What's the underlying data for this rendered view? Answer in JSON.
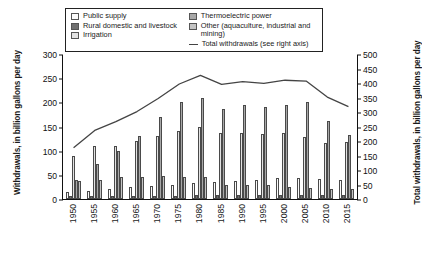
{
  "chart_data": {
    "type": "bar",
    "title": "",
    "xlabel": "",
    "ylabel": "Withdrawals, in billion gallons per day",
    "ylabel_right": "Total withdrawals, in billion gallons per day",
    "categories": [
      "1950",
      "1955",
      "1960",
      "1965",
      "1970",
      "1975",
      "1980",
      "1985",
      "1990",
      "1995",
      "2000",
      "2005",
      "2010",
      "2015"
    ],
    "ylim": [
      0,
      300
    ],
    "yticks": [
      0,
      50,
      100,
      150,
      200,
      250,
      300
    ],
    "ylim_right": [
      0,
      500
    ],
    "yticks_right": [
      0,
      50,
      100,
      150,
      200,
      250,
      300,
      350,
      400,
      450,
      500
    ],
    "grid": false,
    "legend_position": "top",
    "series": [
      {
        "name": "Public supply",
        "color": "#fbfbfb",
        "values": [
          14,
          17,
          21,
          24,
          27,
          29,
          34,
          36,
          38,
          40,
          43,
          44,
          42,
          39
        ]
      },
      {
        "name": "Rural domestic and livestock",
        "color": "#707070",
        "values": [
          6,
          7,
          7,
          7,
          7,
          7,
          8,
          8,
          8,
          9,
          9,
          9,
          9,
          9
        ]
      },
      {
        "name": "Irrigation",
        "color": "#e2e2e2",
        "values": [
          89,
          110,
          110,
          120,
          130,
          140,
          150,
          137,
          137,
          134,
          137,
          128,
          115,
          118
        ]
      },
      {
        "name": "Thermoelectric power",
        "color": "#a8a8a8",
        "values": [
          40,
          72,
          100,
          130,
          170,
          200,
          210,
          187,
          195,
          190,
          195,
          201,
          161,
          133
        ]
      },
      {
        "name": "Other (aquaculture, industrial and mining)",
        "color": "#c4c4c4",
        "values": [
          37,
          39,
          46,
          46,
          47,
          45,
          45,
          30,
          29,
          29,
          25,
          23,
          21,
          20
        ]
      }
    ],
    "line_series": {
      "name": "Total withdrawals (see right axis)",
      "color": "#444444",
      "axis": "right",
      "values": [
        180,
        240,
        270,
        305,
        350,
        400,
        430,
        399,
        408,
        402,
        413,
        410,
        355,
        322
      ]
    }
  },
  "legend": {
    "items": [
      {
        "label": "Public supply",
        "swatch": "public-supply-swatch",
        "type": "box"
      },
      {
        "label": "Rural domestic and livestock",
        "swatch": "rural-domestic-swatch",
        "type": "box"
      },
      {
        "label": "Irrigation",
        "swatch": "irrigation-swatch",
        "type": "box"
      },
      {
        "label": "Thermoelectric power",
        "swatch": "thermoelectric-swatch",
        "type": "box"
      },
      {
        "label": "Other (aquaculture, industrial and mining)",
        "swatch": "other-swatch",
        "type": "box"
      },
      {
        "label": "Total withdrawals (see right axis)",
        "swatch": "total-line-swatch",
        "type": "line"
      }
    ]
  }
}
